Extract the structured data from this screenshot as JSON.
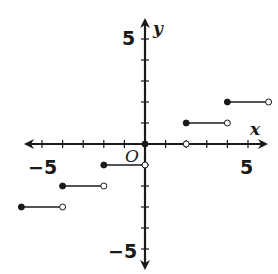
{
  "chart_data": {
    "type": "step",
    "title": "",
    "xlabel": "x",
    "ylabel": "y",
    "origin_label": "O",
    "xlim": [
      -6,
      6
    ],
    "ylim": [
      -5,
      5
    ],
    "x_tick_labels": [
      "-5",
      "5"
    ],
    "y_tick_labels": [
      "5",
      "-5"
    ],
    "grid": false,
    "segments": [
      {
        "x_start": -6,
        "x_end": -4,
        "y": -3,
        "start_closed": true,
        "end_closed": false
      },
      {
        "x_start": -4,
        "x_end": -2,
        "y": -2,
        "start_closed": true,
        "end_closed": false
      },
      {
        "x_start": -2,
        "x_end": 0,
        "y": -1,
        "start_closed": true,
        "end_closed": false
      },
      {
        "x_start": 0,
        "x_end": 2,
        "y": 0,
        "start_closed": true,
        "end_closed": false
      },
      {
        "x_start": 2,
        "x_end": 4,
        "y": 1,
        "start_closed": true,
        "end_closed": false
      },
      {
        "x_start": 4,
        "x_end": 6,
        "y": 2,
        "start_closed": true,
        "end_closed": false
      }
    ]
  },
  "labels": {
    "x_axis": "x",
    "y_axis": "y",
    "origin": "O",
    "x_neg5": "−5",
    "x_pos5": "5",
    "y_pos5": "5",
    "y_neg5": "−5"
  }
}
